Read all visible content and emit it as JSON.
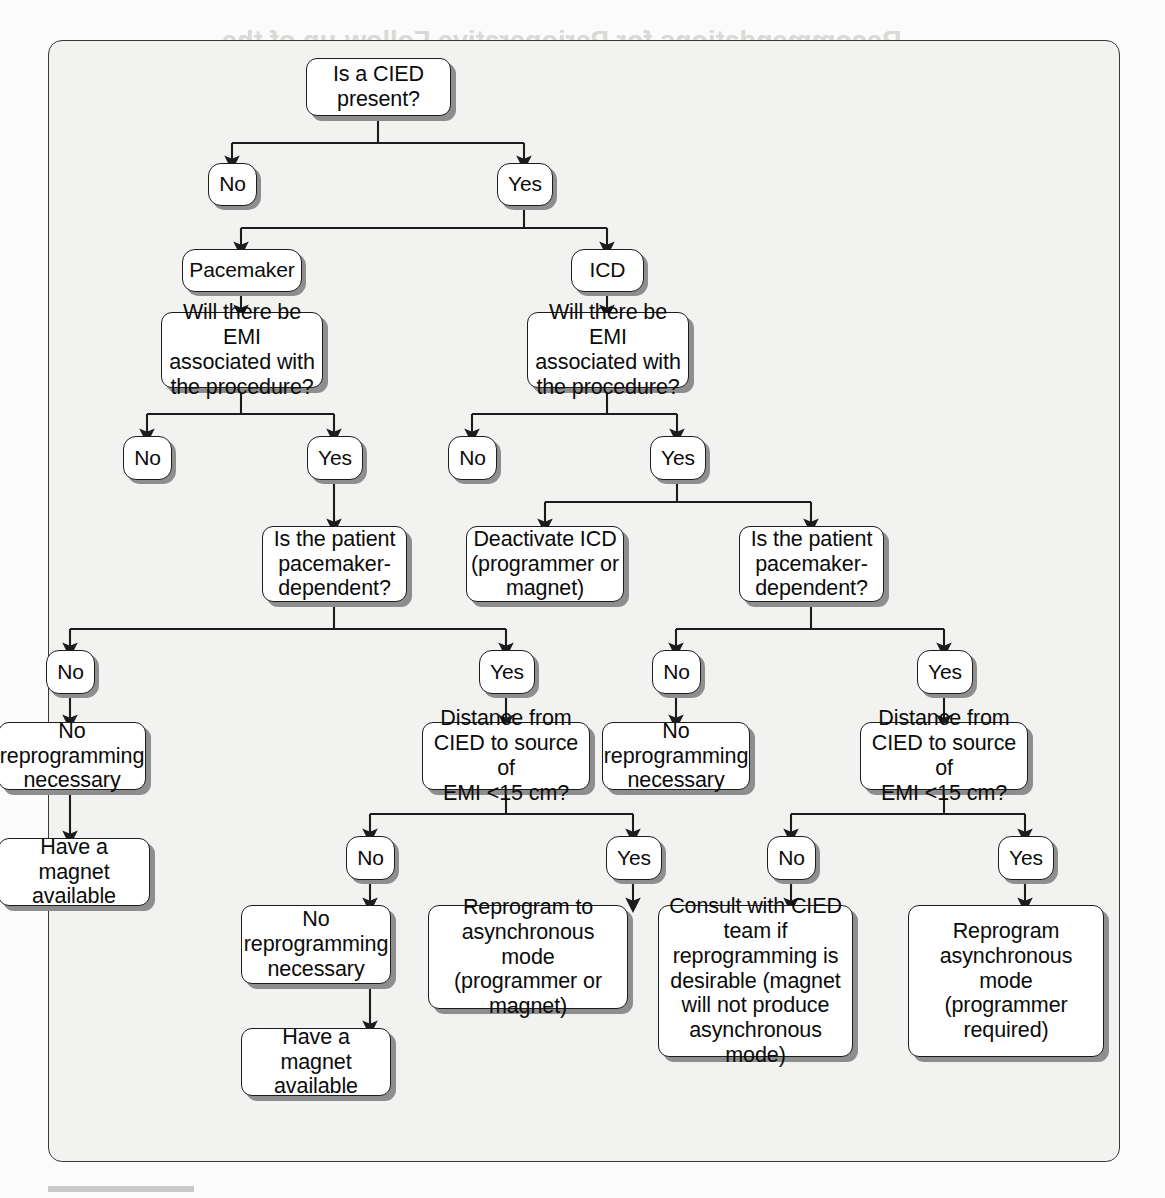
{
  "page": {
    "background_color": "#fbfbfb",
    "frame_color": "#f2f2f0",
    "frame_border_color": "#3a3a3a",
    "node_fill": "#ffffff",
    "node_border": "#1c1c1c",
    "node_shadow": "#8e8e8e",
    "text_color": "#0b0b0b"
  },
  "flowchart": {
    "title": "CIED perioperative management algorithm",
    "nodes": {
      "root": "Is a CIED\npresent?",
      "root_no": "No",
      "root_yes": "Yes",
      "pacemaker": "Pacemaker",
      "icd": "ICD",
      "pm_emi": "Will there be EMI\nassociated with\nthe procedure?",
      "icd_emi": "Will there be EMI\nassociated with\nthe procedure?",
      "pm_emi_no": "No",
      "pm_emi_yes": "Yes",
      "icd_emi_no": "No",
      "icd_emi_yes": "Yes",
      "pm_dependent": "Is the patient\npacemaker-\ndependent?",
      "deactivate_icd": "Deactivate ICD\n(programmer or\nmagnet)",
      "icd_dependent": "Is the patient\npacemaker-\ndependent?",
      "pm_dep_no": "No",
      "pm_dep_yes": "Yes",
      "icd_dep_no": "No",
      "icd_dep_yes": "Yes",
      "pm_no_reprog": "No\nreprogramming\nnecessary",
      "pm_distance": "Distance from\nCIED to source of\nEMI <15 cm?",
      "icd_no_reprog": "No\nreprogramming\nnecessary",
      "icd_distance": "Distance from\nCIED to source of\nEMI <15 cm?",
      "pm_magnet_1": "Have a magnet\navailable",
      "pm_dist_no": "No",
      "pm_dist_yes": "Yes",
      "icd_dist_no": "No",
      "icd_dist_yes": "Yes",
      "pm_no_reprog_2": "No\nreprogramming\nnecessary",
      "pm_reprogram_async": "Reprogram to\nasynchronous mode\n(programmer or\nmagnet)",
      "icd_consult": "Consult with CIED\nteam if\nreprogramming is\ndesirable (magnet\nwill not produce\nasynchronous mode)",
      "icd_reprogram_async": "Reprogram\nasynchronous mode\n(programmer\nrequired)",
      "pm_magnet_2": "Have a magnet\navailable"
    }
  },
  "ghost_text": {
    "t1": "Recommendations for Perioperative Follow-up of the",
    "t2": "Patient With CIED (see Tables C.2 and C.3)",
    "t3": "Note the COR/LOE Assessment of the perioperative monitoring",
    "t4": "Cardiac implantable Electronic Devices Evaluation and implant",
    "t5": "cannot be facilitated by noise and postoperative device management",
    "t6": "should include reprogramming and return the CIED function in the period",
    "t7": "their care and during the operation",
    "t8": "Procedure",
    "t9": "Metabolic and hemodynamic",
    "t10": "Extracorporeal examination",
    "t11": "Electrosurgery and cautery",
    "t12": "Electroconvulsive therapy",
    "t13": "Dental procedures",
    "t14": "Lithotripsy",
    "t15": "Radiation therapy"
  }
}
